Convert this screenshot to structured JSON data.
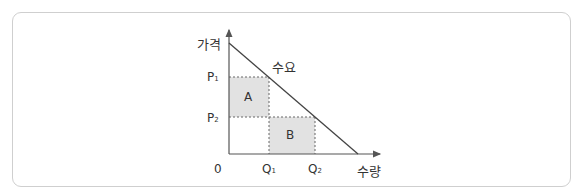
{
  "diagram": {
    "type": "economics-demand-curve",
    "y_axis_label": "가격",
    "x_axis_label": "수량",
    "origin_label": "0",
    "curve_label": "수요",
    "price_labels": {
      "p1": "P",
      "p1_sub": "1",
      "p2": "P",
      "p2_sub": "2"
    },
    "quantity_labels": {
      "q1": "Q",
      "q1_sub": "1",
      "q2": "Q",
      "q2_sub": "2"
    },
    "regions": [
      {
        "id": "A",
        "label": "A",
        "bounds": "P2–P1 × 0–Q1"
      },
      {
        "id": "B",
        "label": "B",
        "bounds": "0–P2 × Q1–Q2"
      }
    ],
    "colors": {
      "axis": "#555555",
      "curve": "#444444",
      "region_fill": "#e2e2e2",
      "dashed": "#666666",
      "frame_border": "#cfcfcf"
    }
  }
}
